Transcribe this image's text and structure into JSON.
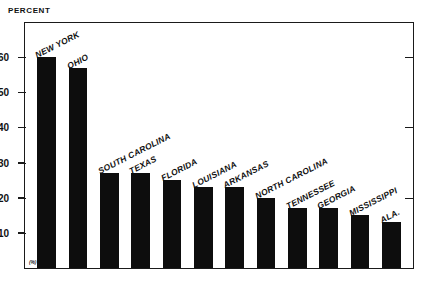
{
  "axis_caption": "PERCENT",
  "origin_mark": "(%)",
  "chart_data": {
    "type": "bar",
    "title": "",
    "subtitle": "",
    "xlabel": "",
    "ylabel": "PERCENT",
    "ylim": [
      0,
      68
    ],
    "yticks": [
      10,
      20,
      30,
      40,
      50,
      60
    ],
    "ytick_labels": [
      "10",
      "20",
      "30",
      "40",
      "50",
      "60"
    ],
    "grid": false,
    "legend": false,
    "legend_position": "none",
    "bar_color": "#0d0d0d",
    "categories": [
      "NEW YORK",
      "OHIO",
      "SOUTH CAROLINA",
      "TEXAS",
      "FLORIDA",
      "LOUISIANA",
      "ARKANSAS",
      "NORTH CAROLINA",
      "TENNESSEE",
      "GEORGIA",
      "MISSISSIPPI",
      "ALA."
    ],
    "values": [
      60,
      57,
      27,
      27,
      25,
      23,
      23,
      20,
      17,
      17,
      15,
      13
    ]
  }
}
